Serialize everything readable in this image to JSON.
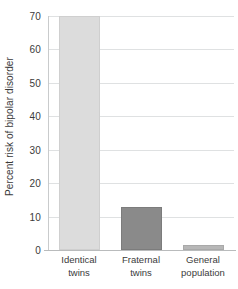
{
  "chart_data": {
    "type": "bar",
    "title": "",
    "subtitle": "",
    "xlabel": "",
    "ylabel": "Percent risk of bipolar disorder",
    "categories": [
      "Identical twins",
      "Fraternal twins",
      "General population"
    ],
    "category_lines": [
      [
        "Identical",
        "twins"
      ],
      [
        "Fraternal",
        "twins"
      ],
      [
        "General",
        "population"
      ]
    ],
    "values": [
      70,
      13,
      1.5
    ],
    "ylim": [
      0,
      70
    ],
    "yticks": [
      0,
      10,
      20,
      30,
      40,
      50,
      60,
      70
    ],
    "ytick_labels": [
      "0",
      "10",
      "20",
      "30",
      "40",
      "50",
      "60",
      "70"
    ],
    "grid": true,
    "legend": false,
    "legend_position": "none",
    "bar_colors": [
      "#dcdcdc",
      "#8a8a8a",
      "#b7b7b7"
    ],
    "bar_border_colors": [
      "#cfcfcf",
      "#7c7c7c",
      "#a9a9a9"
    ],
    "grid_color": "#dfe1e2",
    "axis_color": "#c1c3c4",
    "text_color": "#3b3b3b",
    "background": "#ffffff"
  }
}
